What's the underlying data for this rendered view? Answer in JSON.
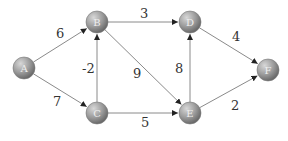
{
  "graph": {
    "type": "directed-weighted",
    "nodes": [
      {
        "id": "A",
        "label": "A",
        "x": 24,
        "y": 68
      },
      {
        "id": "B",
        "label": "B",
        "x": 97,
        "y": 22
      },
      {
        "id": "C",
        "label": "C",
        "x": 97,
        "y": 113
      },
      {
        "id": "D",
        "label": "D",
        "x": 190,
        "y": 22
      },
      {
        "id": "E",
        "label": "E",
        "x": 190,
        "y": 113
      },
      {
        "id": "F",
        "label": "F",
        "x": 268,
        "y": 70
      }
    ],
    "edges": [
      {
        "from": "A",
        "to": "B",
        "weight": "6",
        "lx": 56,
        "ly": 38
      },
      {
        "from": "A",
        "to": "C",
        "weight": "7",
        "lx": 53,
        "ly": 106
      },
      {
        "from": "C",
        "to": "B",
        "weight": "-2",
        "lx": 82,
        "ly": 73
      },
      {
        "from": "B",
        "to": "D",
        "weight": "3",
        "lx": 140,
        "ly": 18
      },
      {
        "from": "B",
        "to": "E",
        "weight": "9",
        "lx": 133,
        "ly": 78
      },
      {
        "from": "C",
        "to": "E",
        "weight": "5",
        "lx": 141,
        "ly": 127
      },
      {
        "from": "E",
        "to": "D",
        "weight": "8",
        "lx": 175,
        "ly": 73
      },
      {
        "from": "D",
        "to": "F",
        "weight": "4",
        "lx": 232,
        "ly": 41
      },
      {
        "from": "E",
        "to": "F",
        "weight": "2",
        "lx": 231,
        "ly": 110
      }
    ]
  }
}
